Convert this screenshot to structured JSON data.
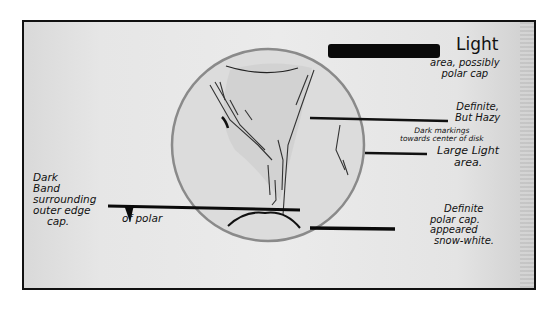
{
  "figure": {
    "frame": {
      "border_color": "#111111",
      "paper_color": "#e8e8e8"
    }
  },
  "annotations": {
    "light_area": {
      "title": "Light",
      "line1": "area, possibly",
      "line2": "polar cap"
    },
    "hazy_markings": {
      "line1": "Definite,",
      "line2": "But Hazy",
      "line3": "Dark markings",
      "line4": "towards center of disk"
    },
    "large_light_area": {
      "line1": "Large Light",
      "line2": "area."
    },
    "dark_band": {
      "line1": "Dark",
      "line2": "Band",
      "line3": "surrounding",
      "line4": "outer edge",
      "line5": "cap."
    },
    "dark_band_inline": "of polar",
    "polar_cap": {
      "line1": "Definite",
      "line2": "polar cap.",
      "line3": "appeared",
      "line4": "snow-white."
    }
  }
}
